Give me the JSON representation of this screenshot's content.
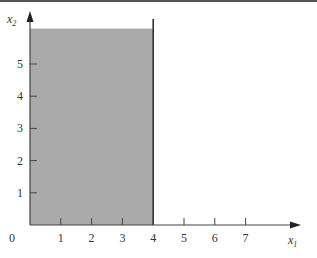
{
  "chart_data": {
    "type": "area",
    "title": "",
    "xlabel": "x1",
    "ylabel": "x2",
    "xlabel_main": "x",
    "xlabel_sub": "1",
    "ylabel_main": "x",
    "ylabel_sub": "2",
    "x_ticks": [
      1,
      2,
      3,
      4,
      5,
      6,
      7
    ],
    "y_ticks": [
      1,
      2,
      3,
      4,
      5
    ],
    "origin_label": "0",
    "xlim": [
      0,
      8.8
    ],
    "ylim": [
      0,
      6.6
    ],
    "grid": false,
    "legend": null,
    "regions": [
      {
        "name": "feasible-region",
        "description": "Shaded region 0 <= x1 <= 4, x2 >= 0 (unbounded above)",
        "x_min": 0,
        "x_max": 4,
        "y_min": 0,
        "y_max": 6.1,
        "fill_color": "#aaaaaa"
      }
    ],
    "lines": [
      {
        "name": "constraint-x1-equals-4",
        "x": 4,
        "y_range": [
          0,
          6.4
        ],
        "color": "#333333"
      }
    ]
  },
  "colors": {
    "region_fill": "#aaaaaa",
    "axis": "#444444",
    "boundary": "#333333",
    "top_rule": "#555555"
  }
}
